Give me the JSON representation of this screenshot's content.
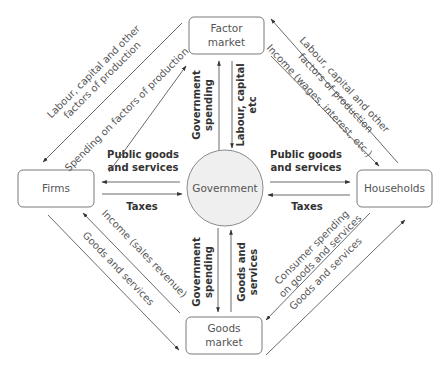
{
  "nodes": {
    "factor_market": {
      "line1": "Factor",
      "line2": "market"
    },
    "firms": {
      "label": "Firms"
    },
    "households": {
      "label": "Households"
    },
    "goods_market": {
      "line1": "Goods",
      "line2": "market"
    },
    "government": {
      "label": "Government"
    }
  },
  "flows": {
    "firms_factor_outer": {
      "line1": "Labour, capital and other",
      "line2": "factors of production"
    },
    "firms_factor_inner": {
      "label": "Spending on factors of production"
    },
    "households_factor_outer": {
      "line1": "Labour, capital and other",
      "line2": "factors of production"
    },
    "households_factor_inner": {
      "label": "Income (wages, interest, etc.)"
    },
    "firms_goods_inner": {
      "label": "Income (sales revenue)"
    },
    "firms_goods_outer": {
      "label": "Goods and services"
    },
    "households_goods_inner": {
      "line1": "Consumer spending",
      "line2": "on goods and services"
    },
    "households_goods_outer": {
      "label": "Goods and services"
    },
    "gov_factor_up": {
      "line1": "Government",
      "line2": "spending"
    },
    "gov_factor_down": {
      "line1": "Labour, capital",
      "line2": "etc"
    },
    "gov_goods_down": {
      "line1": "Government",
      "line2": "spending"
    },
    "gov_goods_up": {
      "line1": "Goods and",
      "line2": "services"
    },
    "gov_firms_public": {
      "line1": "Public goods",
      "line2": "and services"
    },
    "firms_gov_taxes": {
      "label": "Taxes"
    },
    "gov_households_public": {
      "line1": "Public goods",
      "line2": "and services"
    },
    "households_gov_taxes": {
      "label": "Taxes"
    }
  },
  "colors": {
    "government_fill": "#efefef",
    "line": "#5a5a5a",
    "box_border": "#7a7a7a"
  }
}
